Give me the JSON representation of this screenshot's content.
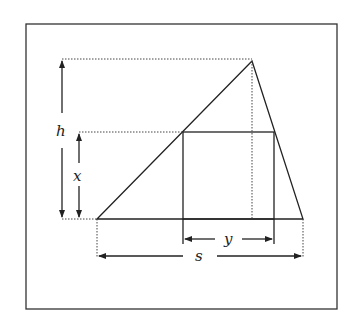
{
  "diagram": {
    "labels": {
      "h": "h",
      "x": "x",
      "y": "y",
      "s": "s"
    },
    "colors": {
      "stroke": "#222222",
      "background": "#ffffff"
    }
  }
}
